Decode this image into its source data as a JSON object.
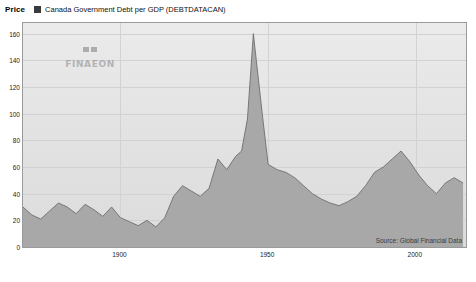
{
  "legend": {
    "price_label": "Price",
    "series_label": "Canada Government Debt per GDP (DEBTDATACAN)",
    "swatch_color": "#3a3a3a"
  },
  "watermark": {
    "text": "FINAEON",
    "mark_name": "finaeon-logo-mark"
  },
  "source": {
    "text": "Source: Global Financial Data"
  },
  "chart_data": {
    "type": "area",
    "title": "Canada Government Debt per GDP (DEBTDATACAN)",
    "xlabel": "",
    "ylabel": "Price",
    "xlim": [
      1867,
      2017
    ],
    "ylim": [
      0,
      168
    ],
    "yticks": [
      0,
      20,
      40,
      60,
      80,
      100,
      120,
      140,
      160
    ],
    "ytick_labels": [
      "0",
      "20",
      "40",
      "60",
      "80",
      "100",
      "120",
      "140",
      "160"
    ],
    "xticks": [
      1900,
      1950,
      2000
    ],
    "xtick_labels": [
      "1900",
      "1950",
      "2000"
    ],
    "grid": true,
    "fill_color": "#a8a8a8",
    "line_color": "#6e6e6e",
    "legend_position": "top-left",
    "x": [
      1867,
      1870,
      1873,
      1876,
      1879,
      1882,
      1885,
      1888,
      1891,
      1894,
      1897,
      1900,
      1903,
      1906,
      1909,
      1912,
      1915,
      1918,
      1921,
      1924,
      1927,
      1930,
      1933,
      1936,
      1939,
      1941,
      1943,
      1945,
      1946,
      1948,
      1950,
      1953,
      1956,
      1959,
      1962,
      1965,
      1968,
      1971,
      1974,
      1977,
      1980,
      1983,
      1986,
      1989,
      1992,
      1995,
      1998,
      2001,
      2004,
      2007,
      2010,
      2013,
      2016
    ],
    "y": [
      30,
      24,
      21,
      27,
      33,
      30,
      25,
      32,
      28,
      23,
      30,
      22,
      19,
      16,
      20,
      15,
      22,
      38,
      46,
      42,
      38,
      44,
      66,
      58,
      68,
      72,
      96,
      160,
      140,
      100,
      62,
      58,
      56,
      52,
      46,
      40,
      36,
      33,
      31,
      34,
      38,
      46,
      56,
      60,
      66,
      72,
      64,
      54,
      46,
      40,
      48,
      52,
      48
    ]
  }
}
